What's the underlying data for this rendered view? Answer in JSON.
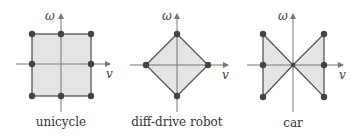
{
  "colors": {
    "fill": "#e4e4e4",
    "edge": "#555555",
    "axis": "#777777",
    "vertex": "#444444"
  },
  "axes": {
    "x_label": "v",
    "y_label": "ω"
  },
  "panels": [
    {
      "id": "unicycle",
      "label": "unicycle",
      "shape": "square"
    },
    {
      "id": "diff-drive",
      "label": "diff-drive robot",
      "shape": "diamond"
    },
    {
      "id": "car",
      "label": "car",
      "shape": "bowtie"
    }
  ]
}
